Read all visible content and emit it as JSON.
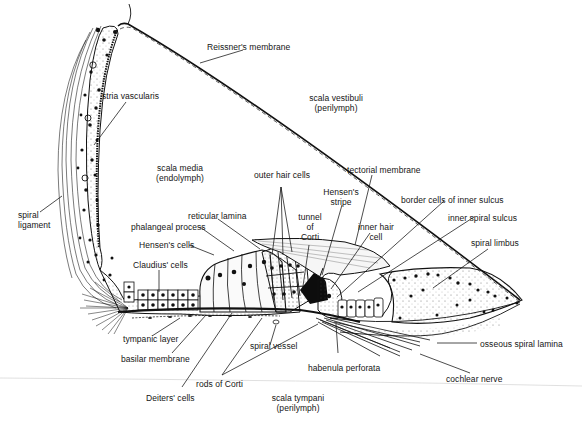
{
  "diagram": {
    "regions": {
      "scala_vestibuli": {
        "name": "scala vestibuli",
        "fluid": "(perilymph)"
      },
      "scala_media": {
        "name": "scala media",
        "fluid": "(endolymph)"
      },
      "scala_tympani": {
        "name": "scala tympani",
        "fluid": "(perilymph)"
      }
    },
    "labels": {
      "reissners_membrane": "Reissner's membrane",
      "stria_vascularis": "stria vascularis",
      "spiral_ligament_1": "spiral",
      "spiral_ligament_2": "ligament",
      "outer_hair_cells": "outer hair cells",
      "tectorial_membrane": "tectorial membrane",
      "hensens_stripe_1": "Hensen's",
      "hensens_stripe_2": "stripe",
      "tunnel_of_corti_1": "tunnel",
      "tunnel_of_corti_2": "of",
      "tunnel_of_corti_3": "Corti",
      "inner_hair_cell_1": "inner hair",
      "inner_hair_cell_2": "cell",
      "border_cells_inner_sulcus": "border cells of inner sulcus",
      "inner_spiral_sulcus": "inner spiral sulcus",
      "spiral_limbus": "spiral limbus",
      "reticular_lamina": "reticular lamina",
      "phalangeal_process": "phalangeal process",
      "hensens_cells": "Hensen's cells",
      "claudius_cells": "Claudius' cells",
      "tympanic_layer": "tympanic layer",
      "basilar_membrane": "basilar membrane",
      "spiral_vessel": "spiral vessel",
      "rods_of_corti": "rods of Corti",
      "deiters_cells": "Deiters' cells",
      "habenula_perforata": "habenula perforata",
      "osseous_spiral_lamina": "osseous spiral lamina",
      "cochlear_nerve": "cochlear nerve"
    },
    "colors": {
      "ink": "#111111",
      "background": "#ffffff",
      "stipple": "#555555"
    }
  }
}
